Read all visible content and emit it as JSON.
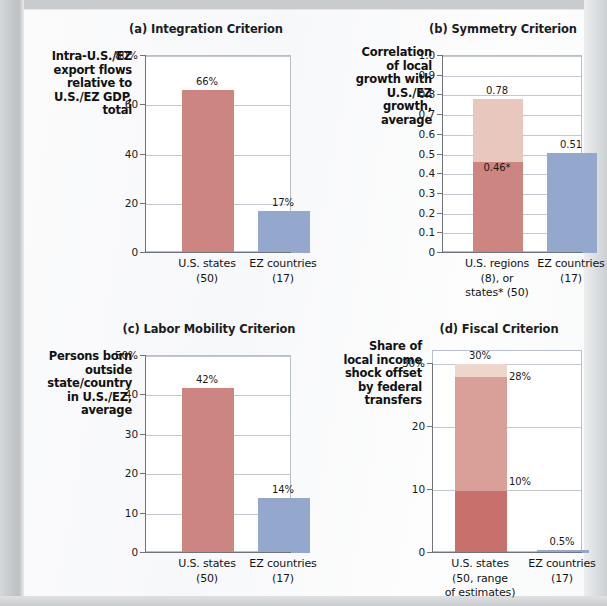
{
  "figure": {
    "panels": [
      {
        "id": "a",
        "title": "(a) Integration Criterion",
        "ylabel": "Intra-U.S./EZ export flows relative to U.S./EZ GDP, total",
        "ylabel_lines": [
          "Intra-U.S./EZ",
          "export flows",
          "relative to",
          "U.S./EZ GDP,",
          "total"
        ],
        "yticks": [
          "80%",
          "60",
          "40",
          "20",
          "0"
        ],
        "ytick_values": [
          80,
          60,
          40,
          20,
          0
        ],
        "categories": [
          {
            "lines": [
              "U.S. states",
              "(50)"
            ],
            "value": 66,
            "label": "66%",
            "color": "#cc8580"
          },
          {
            "lines": [
              "EZ countries",
              "(17)"
            ],
            "value": 17,
            "label": "17%",
            "color": "#93a8cc"
          }
        ]
      },
      {
        "id": "b",
        "title": "(b) Symmetry Criterion",
        "ylabel": "Correlation of local growth with U.S./EZ growth, average",
        "ylabel_lines": [
          "Correlation",
          "of local",
          "growth with",
          "U.S./EZ",
          "growth,",
          "average"
        ],
        "yticks": [
          "1.0",
          "0.9",
          "0.8",
          "0.7",
          "0.6",
          "0.5",
          "0.4",
          "0.3",
          "0.2",
          "0.1",
          "0"
        ],
        "ytick_values": [
          1.0,
          0.9,
          0.8,
          0.7,
          0.6,
          0.5,
          0.4,
          0.3,
          0.2,
          0.1,
          0
        ],
        "categories": [
          {
            "lines": [
              "U.S. regions",
              "(8), or",
              "states* (50)"
            ],
            "value": 0.78,
            "segments": [
              {
                "from": 0,
                "to": 0.46,
                "label": "0.46*",
                "color": "#cc8580"
              },
              {
                "from": 0.46,
                "to": 0.78,
                "label": "0.78",
                "color": "#e8c8be"
              }
            ]
          },
          {
            "lines": [
              "EZ countries",
              "(17)"
            ],
            "value": 0.51,
            "segments": [
              {
                "from": 0,
                "to": 0.51,
                "label": "0.51",
                "color": "#93a8cc"
              }
            ]
          }
        ]
      },
      {
        "id": "c",
        "title": "(c) Labor Mobility Criterion",
        "ylabel": "Persons born outside state/country in U.S./EZ, average",
        "ylabel_lines": [
          "Persons born",
          "outside",
          "state/country",
          "in U.S./EZ,",
          "average"
        ],
        "yticks": [
          "50%",
          "40",
          "30",
          "20",
          "10",
          "0"
        ],
        "ytick_values": [
          50,
          40,
          30,
          20,
          10,
          0
        ],
        "categories": [
          {
            "lines": [
              "U.S. states",
              "(50)"
            ],
            "value": 42,
            "label": "42%",
            "color": "#cc8580"
          },
          {
            "lines": [
              "EZ countries",
              "(17)"
            ],
            "value": 14,
            "label": "14%",
            "color": "#93a8cc"
          }
        ]
      },
      {
        "id": "d",
        "title": "(d) Fiscal Criterion",
        "ylabel": "Share of local income shock offset by federal transfers",
        "ylabel_lines": [
          "Share of",
          "local income",
          "shock offset",
          "by federal",
          "transfers"
        ],
        "yticks": [
          "30%",
          "20",
          "10",
          "0"
        ],
        "ytick_values": [
          30,
          20,
          10,
          0
        ],
        "categories": [
          {
            "lines": [
              "U.S. states",
              "(50, range",
              "of estimates)"
            ],
            "value": 30,
            "segments": [
              {
                "from": 0,
                "to": 10,
                "label": "10%",
                "color": "#c8706c"
              },
              {
                "from": 10,
                "to": 28,
                "label": "28%",
                "color": "#d9a099"
              },
              {
                "from": 28,
                "to": 30,
                "label": "30%",
                "color": "#eed6cd"
              }
            ]
          },
          {
            "lines": [
              "EZ countries",
              "(17)"
            ],
            "value": 0.5,
            "segments": [
              {
                "from": 0,
                "to": 0.5,
                "label": "0.5%",
                "color": "#93a8cc"
              }
            ]
          }
        ]
      }
    ]
  },
  "chart_data": [
    {
      "type": "bar",
      "title": "(a) Integration Criterion",
      "xlabel": "",
      "ylabel": "Intra-U.S./EZ export flows relative to U.S./EZ GDP, total",
      "categories": [
        "U.S. states (50)",
        "EZ countries (17)"
      ],
      "values": [
        66,
        17
      ],
      "data_labels": [
        "66%",
        "17%"
      ],
      "ylim": [
        0,
        80
      ],
      "yticks": [
        0,
        20,
        40,
        60,
        80
      ],
      "ytick_labels": [
        "0",
        "20",
        "40",
        "60",
        "80%"
      ],
      "grid": true,
      "legend": "none",
      "colors": [
        "#cc8580",
        "#93a8cc"
      ]
    },
    {
      "type": "bar",
      "stacked": true,
      "title": "(b) Symmetry Criterion",
      "xlabel": "",
      "ylabel": "Correlation of local growth with U.S./EZ growth, average",
      "categories": [
        "U.S. regions (8), or states* (50)",
        "EZ countries (17)"
      ],
      "series": [
        {
          "name": "regions / lower estimate",
          "values": [
            0.46,
            0.51
          ],
          "color": "#cc8580"
        },
        {
          "name": "states* / upper estimate",
          "values": [
            0.32,
            0.0
          ],
          "color": "#e8c8be"
        }
      ],
      "totals": [
        0.78,
        0.51
      ],
      "data_labels": [
        "0.46*",
        "0.78",
        "0.51"
      ],
      "ylim": [
        0,
        1.0
      ],
      "yticks": [
        0,
        0.1,
        0.2,
        0.3,
        0.4,
        0.5,
        0.6,
        0.7,
        0.8,
        0.9,
        1.0
      ],
      "ytick_labels": [
        "0",
        "0.1",
        "0.2",
        "0.3",
        "0.4",
        "0.5",
        "0.6",
        "0.7",
        "0.8",
        "0.9",
        "1.0"
      ],
      "grid": true,
      "legend": "none",
      "annotation": "* states"
    },
    {
      "type": "bar",
      "title": "(c) Labor Mobility Criterion",
      "xlabel": "",
      "ylabel": "Persons born outside state/country in U.S./EZ, average",
      "categories": [
        "U.S. states (50)",
        "EZ countries (17)"
      ],
      "values": [
        42,
        14
      ],
      "data_labels": [
        "42%",
        "14%"
      ],
      "ylim": [
        0,
        50
      ],
      "yticks": [
        0,
        10,
        20,
        30,
        40,
        50
      ],
      "ytick_labels": [
        "0",
        "10",
        "20",
        "30",
        "40",
        "50%"
      ],
      "grid": true,
      "legend": "none",
      "colors": [
        "#cc8580",
        "#93a8cc"
      ]
    },
    {
      "type": "bar",
      "stacked": true,
      "title": "(d) Fiscal Criterion",
      "xlabel": "",
      "ylabel": "Share of local income shock offset by federal transfers",
      "categories": [
        "U.S. states (50, range of estimates)",
        "EZ countries (17)"
      ],
      "series": [
        {
          "name": "low estimate",
          "values": [
            10,
            0.5
          ],
          "color": "#c8706c"
        },
        {
          "name": "mid estimate",
          "values": [
            18,
            0
          ],
          "color": "#d9a099"
        },
        {
          "name": "high estimate",
          "values": [
            2,
            0
          ],
          "color": "#eed6cd"
        }
      ],
      "totals": [
        30,
        0.5
      ],
      "data_labels": [
        "10%",
        "28%",
        "30%",
        "0.5%"
      ],
      "ylim": [
        0,
        32
      ],
      "yticks": [
        0,
        10,
        20,
        30
      ],
      "ytick_labels": [
        "0",
        "10",
        "20",
        "30%"
      ],
      "grid": true,
      "legend": "none"
    }
  ]
}
